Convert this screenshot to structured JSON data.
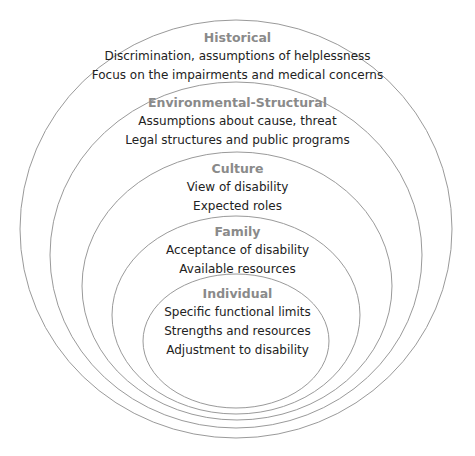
{
  "diagram": {
    "type": "nested-ellipses",
    "stroke_color": "#9a9a9a",
    "heading_color": "#8a8a8a",
    "text_color": "#222222",
    "layers": [
      {
        "name": "Historical",
        "lines": [
          "Discrimination, assumptions of helplessness",
          "Focus on the impairments and medical concerns"
        ]
      },
      {
        "name": "Environmental-Structural",
        "lines": [
          "Assumptions about cause, threat",
          "Legal structures and public programs"
        ]
      },
      {
        "name": "Culture",
        "lines": [
          "View of disability",
          "Expected roles"
        ]
      },
      {
        "name": "Family",
        "lines": [
          "Acceptance of disability",
          "Available resources"
        ]
      },
      {
        "name": "Individual",
        "lines": [
          "Specific functional limits",
          "Strengths and resources",
          "Adjustment to disability"
        ]
      }
    ]
  }
}
